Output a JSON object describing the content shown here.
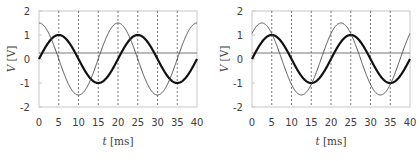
{
  "chart_data": [
    {
      "type": "line",
      "title": "",
      "xlabel": "t [ms]",
      "ylabel": "V [V]",
      "xlim": [
        0,
        40
      ],
      "ylim": [
        -2,
        2
      ],
      "xticks": [
        0,
        5,
        10,
        15,
        20,
        25,
        30,
        35,
        40
      ],
      "yticks": [
        2,
        1,
        0,
        -1,
        -2
      ],
      "grid": "vertical dashed lines at 5, 10, 15, 20, 25, 30, 35",
      "reference_line_y": 0.25,
      "series": [
        {
          "name": "thick",
          "style": "thick dark",
          "function": "1.0*sin(2*pi*t/20)",
          "amplitude": 1.0,
          "period_ms": 20,
          "phase_deg": 0
        },
        {
          "name": "thin",
          "style": "thin dark",
          "function": "1.5*cos(2*pi*t/20)",
          "amplitude": 1.5,
          "period_ms": 20,
          "phase_deg": 90
        }
      ]
    },
    {
      "type": "line",
      "title": "",
      "xlabel": "t [ms]",
      "ylabel": "V [V]",
      "xlim": [
        0,
        40
      ],
      "ylim": [
        -2,
        2
      ],
      "xticks": [
        0,
        5,
        10,
        15,
        20,
        25,
        30,
        35,
        40
      ],
      "yticks": [
        2,
        1,
        0,
        -1,
        -2
      ],
      "grid": "vertical dashed lines at 5, 10, 15, 20, 25, 30, 35",
      "reference_line_y": 0.25,
      "series": [
        {
          "name": "thick",
          "style": "thick dark",
          "function": "1.0*sin(2*pi*t/20)",
          "amplitude": 1.0,
          "period_ms": 20,
          "phase_deg": 0
        },
        {
          "name": "thin",
          "style": "thin dark",
          "function": "1.5*sin(2*pi*t/20 + pi/4)",
          "amplitude": 1.5,
          "period_ms": 20,
          "phase_deg": 45
        }
      ]
    }
  ],
  "labels": {
    "xlabel_italic": "t",
    "xlabel_unit": "[ms]",
    "ylabel_italic": "V",
    "ylabel_unit": "[V]"
  }
}
